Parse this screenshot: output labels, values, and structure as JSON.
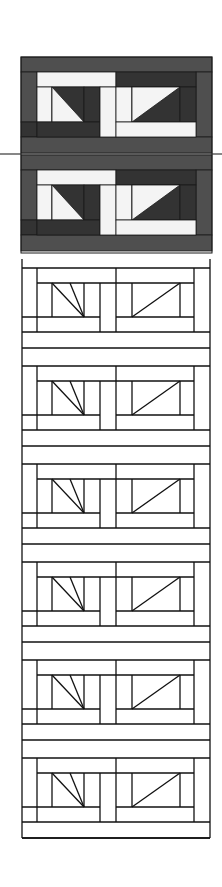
{
  "figure": {
    "width": 222,
    "height": 887,
    "background": "#ffffff",
    "colors": {
      "mid_gray": "#4f4f4f",
      "dark_gray": "#333333",
      "light": "#f4f4f4",
      "line": "#111111"
    },
    "divider_line": {
      "y": 154,
      "x1": 0,
      "x2": 222
    },
    "shaded_section": {
      "x": 21,
      "y": 57,
      "width": 191,
      "height": 196,
      "block_tops": [
        57,
        155
      ]
    },
    "outline_section": {
      "x": 22,
      "y": 259,
      "width": 188,
      "bottom": 838,
      "block_tops": [
        268,
        366,
        464,
        562,
        660,
        758
      ]
    }
  }
}
